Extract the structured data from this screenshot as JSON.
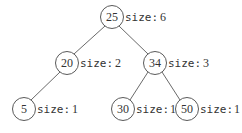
{
  "tree": {
    "size_prefix": "size:",
    "nodes": [
      {
        "id": "n25",
        "value": "25",
        "size": "6",
        "cx": 112,
        "cy": 17
      },
      {
        "id": "n20",
        "value": "20",
        "size": "2",
        "cx": 67,
        "cy": 63
      },
      {
        "id": "n34",
        "value": "34",
        "size": "3",
        "cx": 155,
        "cy": 63
      },
      {
        "id": "n5",
        "value": "5",
        "size": "1",
        "cx": 24,
        "cy": 109
      },
      {
        "id": "n30",
        "value": "30",
        "size": "1",
        "cx": 123,
        "cy": 109
      },
      {
        "id": "n50",
        "value": "50",
        "size": "1",
        "cx": 187,
        "cy": 109
      }
    ],
    "edges": [
      [
        "25",
        "20"
      ],
      [
        "25",
        "34"
      ],
      [
        "20",
        "5"
      ],
      [
        "34",
        "30"
      ],
      [
        "34",
        "50"
      ]
    ]
  }
}
